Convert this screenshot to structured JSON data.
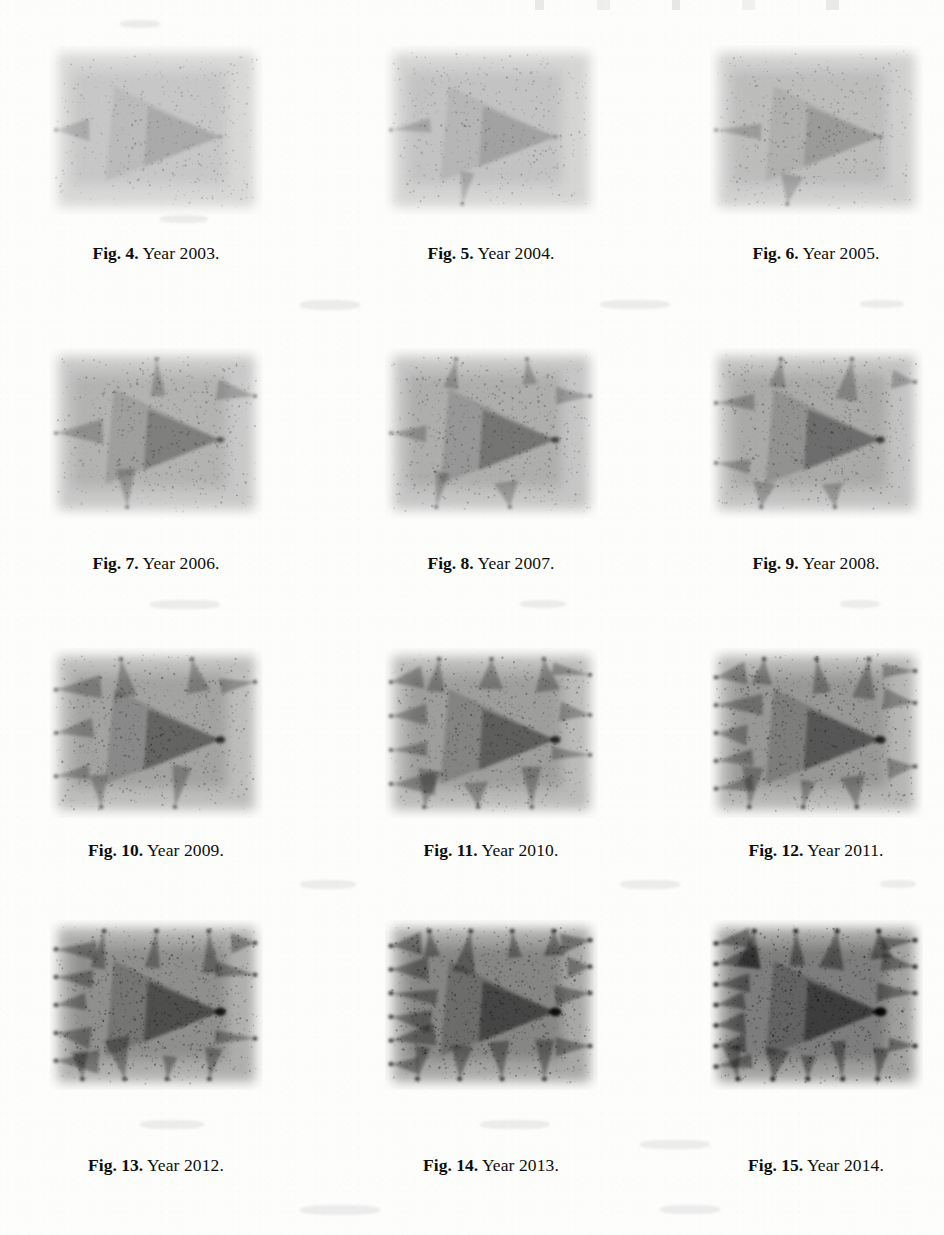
{
  "document": {
    "type": "scanned-journal-page",
    "page_width": 944,
    "page_height": 1235,
    "background_color": "#fdfdfc",
    "ink_color": "#0d0d0d"
  },
  "header_artifact": {
    "visible": true,
    "text": ""
  },
  "figures": [
    {
      "id": "fig-4",
      "label": "Fig. 4.",
      "caption": "Year 2003.",
      "year": "2003",
      "row": 1,
      "col": 1,
      "plot": {
        "density": 0.13,
        "spikes_left": 1,
        "spikes_top": 0,
        "spikes_bottom": 0,
        "spikes_right": 0,
        "main_wedge": 0.05
      }
    },
    {
      "id": "fig-5",
      "label": "Fig. 5.",
      "caption": "Year 2004.",
      "year": "2004",
      "row": 1,
      "col": 2,
      "plot": {
        "density": 0.17,
        "spikes_left": 1,
        "spikes_top": 0,
        "spikes_bottom": 1,
        "spikes_right": 0,
        "main_wedge": 0.1
      }
    },
    {
      "id": "fig-6",
      "label": "Fig. 6.",
      "caption": "Year 2005.",
      "year": "2005",
      "row": 1,
      "col": 3,
      "plot": {
        "density": 0.22,
        "spikes_left": 1,
        "spikes_top": 0,
        "spikes_bottom": 1,
        "spikes_right": 0,
        "main_wedge": 0.14
      }
    },
    {
      "id": "fig-7",
      "label": "Fig. 7.",
      "caption": "Year 2006.",
      "year": "2006",
      "row": 2,
      "col": 1,
      "plot": {
        "density": 0.3,
        "spikes_left": 1,
        "spikes_top": 1,
        "spikes_bottom": 1,
        "spikes_right": 1,
        "main_wedge": 0.4
      }
    },
    {
      "id": "fig-8",
      "label": "Fig. 8.",
      "caption": "Year 2007.",
      "year": "2007",
      "row": 2,
      "col": 2,
      "plot": {
        "density": 0.34,
        "spikes_left": 1,
        "spikes_top": 2,
        "spikes_bottom": 2,
        "spikes_right": 1,
        "main_wedge": 0.5
      }
    },
    {
      "id": "fig-9",
      "label": "Fig. 9.",
      "caption": "Year 2008.",
      "year": "2008",
      "row": 2,
      "col": 3,
      "plot": {
        "density": 0.38,
        "spikes_left": 2,
        "spikes_top": 2,
        "spikes_bottom": 2,
        "spikes_right": 2,
        "main_wedge": 0.58
      }
    },
    {
      "id": "fig-10",
      "label": "Fig. 10.",
      "caption": "Year 2009.",
      "year": "2009",
      "row": 3,
      "col": 1,
      "plot": {
        "density": 0.44,
        "spikes_left": 3,
        "spikes_top": 2,
        "spikes_bottom": 2,
        "spikes_right": 2,
        "main_wedge": 0.66
      }
    },
    {
      "id": "fig-11",
      "label": "Fig. 11.",
      "caption": "Year 2010.",
      "year": "2010",
      "row": 3,
      "col": 2,
      "plot": {
        "density": 0.48,
        "spikes_left": 4,
        "spikes_top": 3,
        "spikes_bottom": 3,
        "spikes_right": 3,
        "main_wedge": 0.72
      }
    },
    {
      "id": "fig-12",
      "label": "Fig. 12.",
      "caption": "Year 2011.",
      "year": "2011",
      "row": 3,
      "col": 3,
      "plot": {
        "density": 0.54,
        "spikes_left": 5,
        "spikes_top": 3,
        "spikes_bottom": 3,
        "spikes_right": 4,
        "main_wedge": 0.78
      }
    },
    {
      "id": "fig-13",
      "label": "Fig. 13.",
      "caption": "Year 2012.",
      "year": "2012",
      "row": 4,
      "col": 1,
      "plot": {
        "density": 0.62,
        "spikes_left": 5,
        "spikes_top": 3,
        "spikes_bottom": 4,
        "spikes_right": 4,
        "main_wedge": 0.85
      }
    },
    {
      "id": "fig-14",
      "label": "Fig. 14.",
      "caption": "Year 2013.",
      "year": "2013",
      "row": 4,
      "col": 2,
      "plot": {
        "density": 0.7,
        "spikes_left": 6,
        "spikes_top": 4,
        "spikes_bottom": 4,
        "spikes_right": 5,
        "main_wedge": 0.92
      }
    },
    {
      "id": "fig-15",
      "label": "Fig. 15.",
      "caption": "Year 2014.",
      "year": "2014",
      "row": 4,
      "col": 3,
      "plot": {
        "density": 0.78,
        "spikes_left": 7,
        "spikes_top": 4,
        "spikes_bottom": 5,
        "spikes_right": 5,
        "main_wedge": 1.0
      }
    }
  ],
  "chart_data": {
    "type": "scatter",
    "title": "",
    "xlabel": "",
    "ylabel": "",
    "series": [
      {
        "name": "2003",
        "figure": "Fig. 4.",
        "density": 0.13,
        "boundary_spikes": 1
      },
      {
        "name": "2004",
        "figure": "Fig. 5.",
        "density": 0.17,
        "boundary_spikes": 2
      },
      {
        "name": "2005",
        "figure": "Fig. 6.",
        "density": 0.22,
        "boundary_spikes": 2
      },
      {
        "name": "2006",
        "figure": "Fig. 7.",
        "density": 0.3,
        "boundary_spikes": 4
      },
      {
        "name": "2007",
        "figure": "Fig. 8.",
        "density": 0.34,
        "boundary_spikes": 6
      },
      {
        "name": "2008",
        "figure": "Fig. 9.",
        "density": 0.38,
        "boundary_spikes": 8
      },
      {
        "name": "2009",
        "figure": "Fig. 10.",
        "density": 0.44,
        "boundary_spikes": 9
      },
      {
        "name": "2010",
        "figure": "Fig. 11.",
        "density": 0.48,
        "boundary_spikes": 13
      },
      {
        "name": "2011",
        "figure": "Fig. 12.",
        "density": 0.54,
        "boundary_spikes": 15
      },
      {
        "name": "2012",
        "figure": "Fig. 13.",
        "density": 0.62,
        "boundary_spikes": 16
      },
      {
        "name": "2013",
        "figure": "Fig. 14.",
        "density": 0.7,
        "boundary_spikes": 19
      },
      {
        "name": "2014",
        "figure": "Fig. 15.",
        "density": 0.78,
        "boundary_spikes": 21
      }
    ],
    "categories": [
      "2003",
      "2004",
      "2005",
      "2006",
      "2007",
      "2008",
      "2009",
      "2010",
      "2011",
      "2012",
      "2013",
      "2014"
    ],
    "values": [
      0.13,
      0.17,
      0.22,
      0.3,
      0.34,
      0.38,
      0.44,
      0.48,
      0.54,
      0.62,
      0.7,
      0.78
    ],
    "grid": false,
    "legend": "none"
  }
}
